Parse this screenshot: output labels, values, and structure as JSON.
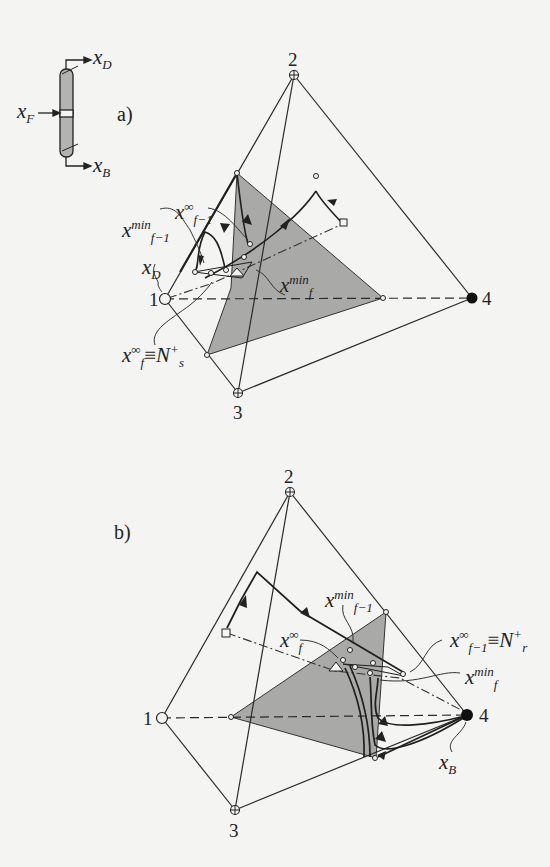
{
  "figure": {
    "column_schematic": {
      "feed_label": "x",
      "feed_sub": "F",
      "distillate_label": "x",
      "distillate_sub": "D",
      "bottoms_label": "x",
      "bottoms_sub": "B"
    },
    "panels": [
      {
        "id": "a",
        "label": "a)",
        "vertices": {
          "v1": "1",
          "v2": "2",
          "v3": "3",
          "v4": "4"
        },
        "annotations": {
          "x_f1_inf": {
            "base": "x",
            "sup": "∞",
            "sub": "f−1"
          },
          "x_f1_min": {
            "base": "x",
            "sup": "min",
            "sub": "f−1"
          },
          "x_D": {
            "base": "x",
            "sub": "D"
          },
          "x_f_min": {
            "base": "x",
            "sup": "min",
            "sub": "f"
          },
          "x_f_inf_Ns": {
            "base": "x",
            "sup": "∞",
            "sub": "f",
            "equiv": "≡",
            "rhs": "N",
            "rhs_sup": "+",
            "rhs_sub": "s"
          }
        }
      },
      {
        "id": "b",
        "label": "b)",
        "vertices": {
          "v1": "1",
          "v2": "2",
          "v3": "3",
          "v4": "4"
        },
        "annotations": {
          "x_f1_min": {
            "base": "x",
            "sup": "min",
            "sub": "f−1"
          },
          "x_f_inf": {
            "base": "x",
            "sup": "∞",
            "sub": "f"
          },
          "x_f1_inf_Nr": {
            "base": "x",
            "sup": "∞",
            "sub": "f−1",
            "equiv": "≡",
            "rhs": "N",
            "rhs_sup": "+",
            "rhs_sub": "r"
          },
          "x_f_min": {
            "base": "x",
            "sup": "min",
            "sub": "f"
          },
          "x_B": {
            "base": "x",
            "sub": "B"
          }
        }
      }
    ],
    "colors": {
      "shade": "#a9a9a7",
      "line": "#2a2a2a",
      "background": "#f4f4f2"
    }
  }
}
